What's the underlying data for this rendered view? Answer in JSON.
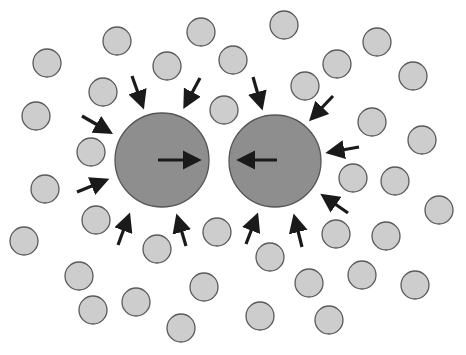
{
  "diagram": {
    "colors": {
      "background": "#ffffff",
      "large_fill": "#8e8e8e",
      "large_stroke": "#555555",
      "small_fill": "#cdcdcd",
      "small_stroke": "#5a5a5a",
      "arrow": "#1a1a1a"
    },
    "large_particles": [
      {
        "id": "left",
        "cx": 162,
        "cy": 160,
        "r": 47
      },
      {
        "id": "right",
        "cx": 275,
        "cy": 161,
        "r": 46
      }
    ],
    "inner_arrows": [
      {
        "id": "left-inner",
        "x1": 158,
        "y1": 160,
        "x2": 196,
        "y2": 160
      },
      {
        "id": "right-inner",
        "x1": 277,
        "y1": 160,
        "x2": 242,
        "y2": 160
      }
    ],
    "outer_arrows": [
      {
        "x1": 132,
        "y1": 76,
        "x2": 142,
        "y2": 104
      },
      {
        "x1": 200,
        "y1": 78,
        "x2": 186,
        "y2": 104
      },
      {
        "x1": 82,
        "y1": 116,
        "x2": 108,
        "y2": 131
      },
      {
        "x1": 77,
        "y1": 192,
        "x2": 104,
        "y2": 181
      },
      {
        "x1": 118,
        "y1": 245,
        "x2": 128,
        "y2": 218
      },
      {
        "x1": 186,
        "y1": 246,
        "x2": 178,
        "y2": 219
      },
      {
        "x1": 253,
        "y1": 77,
        "x2": 261,
        "y2": 105
      },
      {
        "x1": 333,
        "y1": 96,
        "x2": 313,
        "y2": 117
      },
      {
        "x1": 359,
        "y1": 147,
        "x2": 331,
        "y2": 152
      },
      {
        "x1": 348,
        "y1": 213,
        "x2": 325,
        "y2": 197
      },
      {
        "x1": 246,
        "y1": 244,
        "x2": 256,
        "y2": 218
      },
      {
        "x1": 302,
        "y1": 247,
        "x2": 295,
        "y2": 219
      }
    ],
    "small_particles": {
      "r": 14,
      "positions": [
        [
          117,
          41
        ],
        [
          47,
          63
        ],
        [
          103,
          92
        ],
        [
          36,
          116
        ],
        [
          91,
          152
        ],
        [
          45,
          189
        ],
        [
          96,
          220
        ],
        [
          24,
          241
        ],
        [
          201,
          32
        ],
        [
          167,
          66
        ],
        [
          233,
          60
        ],
        [
          284,
          25
        ],
        [
          305,
          86
        ],
        [
          224,
          110
        ],
        [
          377,
          42
        ],
        [
          337,
          64
        ],
        [
          413,
          76
        ],
        [
          372,
          122
        ],
        [
          422,
          140
        ],
        [
          353,
          178
        ],
        [
          395,
          181
        ],
        [
          439,
          210
        ],
        [
          336,
          234
        ],
        [
          386,
          236
        ],
        [
          157,
          249
        ],
        [
          217,
          232
        ],
        [
          79,
          276
        ],
        [
          93,
          310
        ],
        [
          136,
          302
        ],
        [
          204,
          287
        ],
        [
          181,
          328
        ],
        [
          270,
          257
        ],
        [
          309,
          283
        ],
        [
          362,
          275
        ],
        [
          415,
          285
        ],
        [
          260,
          316
        ],
        [
          329,
          320
        ]
      ]
    }
  }
}
